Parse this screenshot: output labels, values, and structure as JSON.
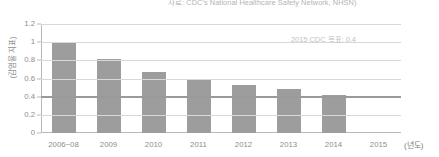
{
  "chart_data": {
    "type": "bar",
    "title": "",
    "source_note": "자료: CDC's National Healthcare Safety Network, NHSN)",
    "categories": [
      "2006~08",
      "2009",
      "2010",
      "2011",
      "2012",
      "2013",
      "2014",
      "2015"
    ],
    "values": [
      0.99,
      0.81,
      0.67,
      0.59,
      0.53,
      0.48,
      0.42,
      null
    ],
    "xlabel": "(년도)",
    "ylabel": "(감염율 지표)",
    "ylim": [
      0,
      1.2
    ],
    "yticks": [
      "0",
      "0.2",
      "0.4",
      "0.6",
      "0.8",
      "1",
      "1.2"
    ],
    "ytick_values": [
      0,
      0.2,
      0.4,
      0.6,
      0.8,
      1,
      1.2
    ],
    "grid": true,
    "legend": "none",
    "annotations": [
      {
        "text": "2015 CDC 목표: 0.4",
        "value": 0.4
      }
    ],
    "target_line": {
      "label": "2015 CDC 목표: 0.4",
      "value": 0.4,
      "color": "#9a9a9a"
    },
    "bar_color": "#9d9d9d",
    "gridline_color": "#d8d8d8",
    "axis_color": "#b9b9b9",
    "text_color": "#8e8e8e"
  }
}
